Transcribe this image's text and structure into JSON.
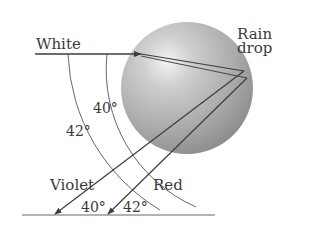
{
  "diagram": {
    "labels": {
      "incoming": "White",
      "drop_line1": "Rain",
      "drop_line2": "drop",
      "arc_inner": "40°",
      "arc_outer": "42°",
      "violet": "Violet",
      "red": "Red",
      "angle_violet": "40°",
      "angle_red": "42°"
    },
    "colors": {
      "ray": "#3c3c3c",
      "arc": "#555555",
      "text": "#3a3a3a",
      "drop_light": "#f2f2f2",
      "drop_mid": "#bdbdbd",
      "drop_dark": "#8e8e8e",
      "baseline": "#555555"
    },
    "geometry": {
      "drop": {
        "cx": 187,
        "cy": 88,
        "r": 66
      },
      "incoming_ray": {
        "x1": 35,
        "y1": 54,
        "x2": 141,
        "y2": 54
      },
      "violet_path": [
        [
          141,
          54
        ],
        [
          244,
          71
        ],
        [
          55,
          214
        ]
      ],
      "red_path": [
        [
          141,
          56
        ],
        [
          247,
          78
        ],
        [
          108,
          214
        ]
      ],
      "baseline": {
        "x1": 22,
        "y1": 215,
        "x2": 215,
        "y2": 215
      }
    }
  }
}
